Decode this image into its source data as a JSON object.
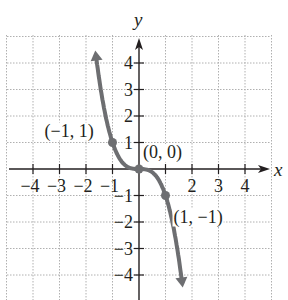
{
  "chart_data": {
    "type": "line",
    "title": "",
    "xlabel": "x",
    "ylabel": "y",
    "xlim": [
      -5,
      5
    ],
    "ylim": [
      -5,
      5
    ],
    "grid": true,
    "x_ticks": [
      -4,
      -3,
      -2,
      -1,
      1,
      2,
      3,
      4
    ],
    "y_ticks": [
      -4,
      -3,
      -2,
      -1,
      1,
      2,
      3,
      4
    ],
    "x_tick_labels": [
      "−4",
      "−3",
      "−2",
      "−1",
      "",
      "2",
      "3",
      "4"
    ],
    "y_tick_labels": [
      "−4",
      "−3",
      "−2",
      "−1",
      "1",
      "2",
      "3",
      "4"
    ],
    "series": [
      {
        "name": "curve",
        "function": "y = -x^3",
        "x": [
          -1.65,
          -1.5,
          -1.25,
          -1,
          -0.75,
          -0.5,
          -0.25,
          0,
          0.25,
          0.5,
          0.75,
          1,
          1.25,
          1.5,
          1.65
        ],
        "y": [
          4.49,
          3.38,
          1.95,
          1,
          0.42,
          0.13,
          0.02,
          0,
          -0.02,
          -0.13,
          -0.42,
          -1,
          -1.95,
          -3.38,
          -4.49
        ],
        "color": "#6d6e71",
        "arrows": "both ends"
      }
    ],
    "annotations": [
      {
        "text": "(−1, 1)",
        "x": -1,
        "y": 1
      },
      {
        "text": "(0, 0)",
        "x": 0,
        "y": 0
      },
      {
        "text": "(1, −1)",
        "x": 1,
        "y": -1
      }
    ],
    "points": [
      {
        "x": -1,
        "y": 1
      },
      {
        "x": 0,
        "y": 0
      },
      {
        "x": 1,
        "y": -1
      }
    ]
  },
  "colors": {
    "axis": "#231f20",
    "grid": "#b0b0b0",
    "curve": "#6d6e71"
  }
}
